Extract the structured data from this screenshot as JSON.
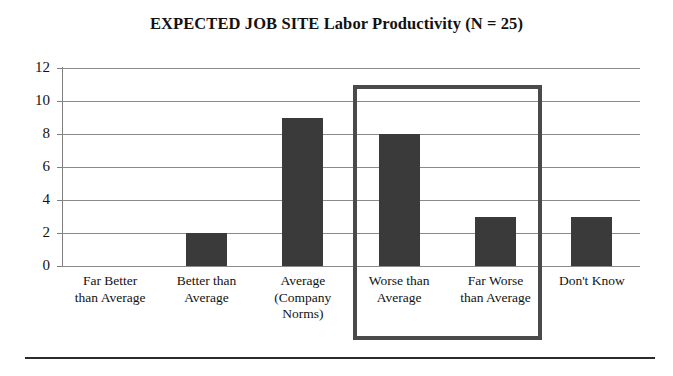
{
  "chart_data": {
    "type": "bar",
    "title": "EXPECTED JOB SITE Labor Productivity (N = 25)",
    "xlabel": "",
    "ylabel": "",
    "categories": [
      "Far Better than Average",
      "Better than Average",
      "Average (Company Norms)",
      "Worse than Average",
      "Far Worse than Average",
      "Don't Know"
    ],
    "category_lines": [
      [
        "Far Better",
        "than Average"
      ],
      [
        "Better than",
        "Average"
      ],
      [
        "Average",
        "(Company",
        "Norms)"
      ],
      [
        "Worse than",
        "Average"
      ],
      [
        "Far Worse",
        "than Average"
      ],
      [
        "Don't Know"
      ]
    ],
    "values": [
      0,
      2,
      9,
      8,
      3,
      3
    ],
    "ylim": [
      0,
      12
    ],
    "yticks": [
      0,
      2,
      4,
      6,
      8,
      10,
      12
    ],
    "ytick_labels": [
      "0",
      "2",
      "4",
      "6",
      "8",
      "10",
      "12"
    ],
    "grid": true,
    "legend": "none",
    "bar_color": "#3a3a3a",
    "gridline_color": "#8a8a8a",
    "axis_color": "#7d7d7d",
    "annotations": [
      {
        "name": "highlight-box",
        "type": "rectangle",
        "covers_categories": [
          "Worse than Average",
          "Far Worse than Average"
        ],
        "color": "#4a4a4a",
        "top_value": 11
      }
    ]
  }
}
